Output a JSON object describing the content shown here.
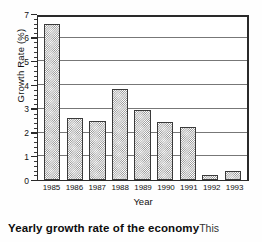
{
  "chart_data": {
    "type": "bar",
    "title": "",
    "xlabel": "Year",
    "ylabel": "Growth Rate (%)",
    "categories": [
      "1985",
      "1986",
      "1987",
      "1988",
      "1989",
      "1990",
      "1991",
      "1992",
      "1993"
    ],
    "values": [
      6.6,
      2.6,
      2.5,
      3.85,
      2.95,
      2.45,
      2.25,
      0.2,
      0.4
    ],
    "ylim": [
      0,
      7
    ],
    "yticks": [
      0,
      1,
      2,
      3,
      4,
      5,
      6,
      7
    ],
    "ytick_labels": [
      "0",
      "1",
      "2",
      "3",
      "4",
      "5",
      "6",
      "7"
    ],
    "minor_ticks_per_interval": 5,
    "grid": "horizontal",
    "legend": "none",
    "bar_fill": "dither-gray-hatch",
    "bar_edge_color": "#3a3a3a",
    "bar_fill_color": "#8a8a8a",
    "axis_color": "#2a2a2a",
    "gridline_color": "#777777",
    "background_color": "#ffffff"
  },
  "caption": {
    "bold_text": "Yearly growth rate of the economy",
    "rest_text": "This"
  }
}
